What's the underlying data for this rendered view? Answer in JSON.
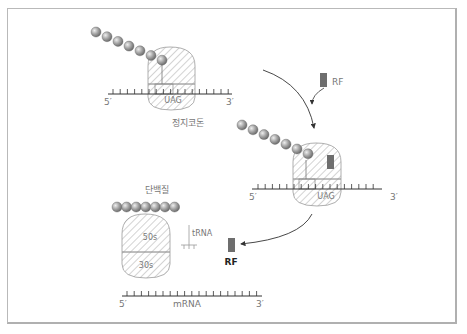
{
  "diagram": {
    "colors": {
      "frame": "#b9b9b9",
      "line": "#444444",
      "hatch": "#9a9a9a",
      "bead_fill": "#9c9c9c",
      "bead_highlight": "#e2e2e2",
      "rf": "#6e6e6e",
      "label": "#777777",
      "label_dark": "#222222"
    },
    "stage1": {
      "five_prime": "5′",
      "three_prime": "3′",
      "codon": "UAG",
      "caption": "정지코돈",
      "bead_count": 7
    },
    "stage2": {
      "rf_label": "RF",
      "five_prime": "5′",
      "three_prime": "3′",
      "codon": "UAG",
      "bead_count": 7
    },
    "stage3": {
      "protein_label": "단백질",
      "large_subunit": "50s",
      "small_subunit": "30s",
      "trna_label": "tRNA",
      "rf_label": "RF",
      "five_prime": "5′",
      "mrna_label": "mRNA",
      "three_prime": "3′",
      "bead_count": 7
    }
  }
}
